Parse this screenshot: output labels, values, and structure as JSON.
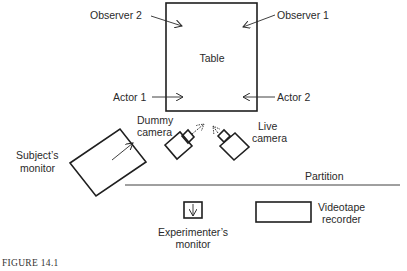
{
  "diagram": {
    "labels": {
      "observer2": "Observer 2",
      "observer1": "Observer 1",
      "table": "Table",
      "actor1": "Actor 1",
      "actor2": "Actor 2",
      "dummy_camera_line1": "Dummy",
      "dummy_camera_line2": "camera",
      "live_camera_line1": "Live",
      "live_camera_line2": "camera",
      "subjects_monitor_line1": "Subject’s",
      "subjects_monitor_line2": "monitor",
      "partition": "Partition",
      "experimenters_monitor_line1": "Experimenter’s",
      "experimenters_monitor_line2": "monitor",
      "videotape_line1": "Videotape",
      "videotape_line2": "recorder"
    },
    "caption": "FIGURE 14.1"
  }
}
